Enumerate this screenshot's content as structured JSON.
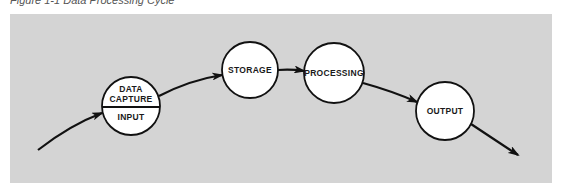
{
  "caption": "Figure 1-1 Data Processing Cycle",
  "colors": {
    "panel_background": "#d4d4d4",
    "node_fill": "#ffffff",
    "stroke": "#111111",
    "text": "#1a1a1a"
  },
  "nodes": [
    {
      "id": "input",
      "top_label_line1": "DATA",
      "top_label_line2": "CAPTURE",
      "bottom_label": "INPUT",
      "cx": 131,
      "cy": 106,
      "r": 29
    },
    {
      "id": "storage",
      "label": "STORAGE",
      "cx": 250,
      "cy": 70,
      "r": 28
    },
    {
      "id": "processing",
      "label": "PROCESSING",
      "cx": 334,
      "cy": 73,
      "r": 30
    },
    {
      "id": "output",
      "label": "OUTPUT",
      "cx": 445,
      "cy": 111,
      "r": 29
    }
  ],
  "arrows": [
    {
      "from": "start",
      "to": "input"
    },
    {
      "from": "input",
      "to": "storage"
    },
    {
      "from": "storage",
      "to": "processing"
    },
    {
      "from": "processing",
      "to": "output"
    },
    {
      "from": "output",
      "to": "end"
    }
  ]
}
